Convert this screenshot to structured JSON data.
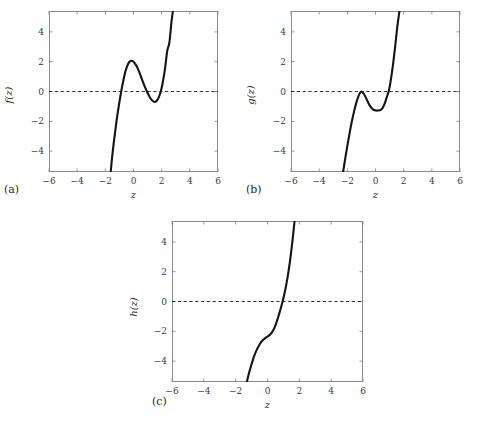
{
  "figure": {
    "background": "#ffffff",
    "curve_color": "#141414",
    "frame_color": "#8a8a8a",
    "zeroline_color": "#1a1a1a"
  },
  "panels": [
    {
      "label": "(a)",
      "xlabel": "z",
      "ylabel": "f(z)",
      "xticks": [
        "−6",
        "−4",
        "−2",
        "0",
        "2",
        "4",
        "6"
      ],
      "yticks": [
        "4",
        "2",
        "0",
        "−2",
        "−4"
      ]
    },
    {
      "label": "(b)",
      "xlabel": "z",
      "ylabel": "g(z)",
      "xticks": [
        "−6",
        "−4",
        "−2",
        "0",
        "2",
        "4",
        "6"
      ],
      "yticks": [
        "4",
        "2",
        "0",
        "−2",
        "−4"
      ]
    },
    {
      "label": "(c)",
      "xlabel": "z",
      "ylabel": "h(z)",
      "xticks": [
        "−6",
        "−4",
        "−2",
        "0",
        "2",
        "4",
        "6"
      ],
      "yticks": [
        "4",
        "2",
        "0",
        "−2",
        "−4"
      ]
    }
  ],
  "chart_data": [
    {
      "type": "line",
      "title": "",
      "panel": "(a)",
      "xlabel": "z",
      "ylabel": "f(z)",
      "xlim": [
        -6,
        6
      ],
      "ylim": [
        -5.4,
        5.4
      ],
      "xticks": [
        -6,
        -4,
        -2,
        0,
        2,
        4,
        6
      ],
      "yticks": [
        -4,
        -2,
        0,
        2,
        4
      ],
      "grid": false,
      "legend": "none",
      "annotations": [
        "dashed horizontal reference line at y = 0"
      ],
      "series": [
        {
          "name": "f(z)",
          "description": "cubic with local maximum ~(-0.25, 2.05) and local minimum ~(1.50, -0.70); roots near z = -1.05, 1.05 and 1.95",
          "x": [
            -1.62,
            -1.5,
            -1.35,
            -1.2,
            -1.05,
            -0.9,
            -0.75,
            -0.6,
            -0.45,
            -0.3,
            -0.15,
            0.0,
            0.15,
            0.3,
            0.45,
            0.6,
            0.75,
            0.9,
            1.05,
            1.2,
            1.35,
            1.5,
            1.65,
            1.8,
            1.95,
            2.1,
            2.25,
            2.4,
            2.55,
            2.7,
            2.8
          ],
          "y": [
            -5.4,
            -4.25,
            -3.05,
            -1.95,
            -1.0,
            -0.15,
            0.6,
            1.25,
            1.7,
            1.98,
            2.06,
            2.0,
            1.82,
            1.55,
            1.2,
            0.82,
            0.45,
            0.12,
            -0.18,
            -0.45,
            -0.62,
            -0.7,
            -0.62,
            -0.38,
            0.05,
            0.72,
            1.62,
            2.75,
            3.3,
            4.7,
            5.4
          ]
        }
      ]
    },
    {
      "type": "line",
      "title": "",
      "panel": "(b)",
      "xlabel": "z",
      "ylabel": "g(z)",
      "xlim": [
        -6,
        6
      ],
      "ylim": [
        -5.4,
        5.4
      ],
      "xticks": [
        -6,
        -4,
        -2,
        0,
        2,
        4,
        6
      ],
      "yticks": [
        -4,
        -2,
        0,
        2,
        4
      ],
      "grid": false,
      "legend": "none",
      "annotations": [
        "dashed horizontal reference line at y = 0"
      ],
      "series": [
        {
          "name": "g(z)",
          "description": "cubic tangent to y = 0 at local maximum z = -1.0, local minimum ~(0.35, -1.25), rising root near z = 0.95",
          "x": [
            -2.3,
            -2.15,
            -2.0,
            -1.85,
            -1.7,
            -1.55,
            -1.4,
            -1.25,
            -1.1,
            -1.0,
            -0.85,
            -0.7,
            -0.55,
            -0.4,
            -0.25,
            -0.1,
            0.05,
            0.2,
            0.35,
            0.5,
            0.65,
            0.8,
            0.95,
            1.1,
            1.25,
            1.4,
            1.55,
            1.7
          ],
          "y": [
            -5.4,
            -4.5,
            -3.65,
            -2.85,
            -2.1,
            -1.45,
            -0.88,
            -0.42,
            -0.08,
            0.0,
            -0.12,
            -0.38,
            -0.68,
            -0.95,
            -1.14,
            -1.24,
            -1.28,
            -1.27,
            -1.25,
            -1.12,
            -0.82,
            -0.38,
            0.05,
            0.85,
            1.85,
            3.05,
            4.35,
            5.4
          ]
        }
      ]
    },
    {
      "type": "line",
      "title": "",
      "panel": "(c)",
      "xlabel": "z",
      "ylabel": "h(z)",
      "xlim": [
        -6,
        6
      ],
      "ylim": [
        -5.4,
        5.4
      ],
      "xticks": [
        -6,
        -4,
        -2,
        0,
        2,
        4,
        6
      ],
      "yticks": [
        -4,
        -2,
        0,
        2,
        4
      ],
      "grid": false,
      "legend": "none",
      "annotations": [
        "dashed horizontal reference line at y = 0"
      ],
      "series": [
        {
          "name": "h(z)",
          "description": "monotonically increasing curve with an inflection plateau near (0.0, -2.3); single root near z = 1.0",
          "x": [
            -1.3,
            -1.15,
            -1.0,
            -0.85,
            -0.7,
            -0.55,
            -0.4,
            -0.25,
            -0.1,
            0.05,
            0.2,
            0.35,
            0.5,
            0.65,
            0.8,
            0.95,
            1.1,
            1.25,
            1.4,
            1.55,
            1.7
          ],
          "y": [
            -5.4,
            -4.75,
            -4.2,
            -3.7,
            -3.3,
            -2.98,
            -2.72,
            -2.55,
            -2.42,
            -2.32,
            -2.18,
            -1.95,
            -1.6,
            -1.12,
            -0.58,
            0.0,
            0.7,
            1.55,
            2.6,
            3.9,
            5.4
          ]
        }
      ]
    }
  ]
}
